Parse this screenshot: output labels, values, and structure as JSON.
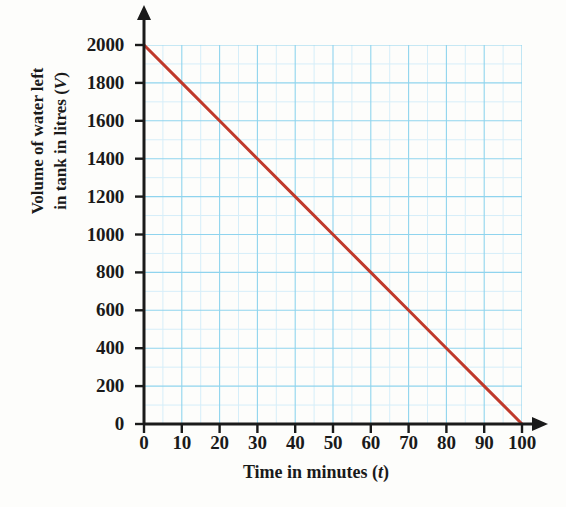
{
  "chart_data": {
    "type": "line",
    "title": "",
    "xlabel": "Time in minutes (t)",
    "xlabel_text": "Time in minutes",
    "xlabel_var": "t",
    "ylabel": "Volume of water left in tank in litres (V)",
    "ylabel_line1": "Volume of water left",
    "ylabel_line2_text": "in tank in litres",
    "ylabel_var": "V",
    "xlim": [
      0,
      100
    ],
    "ylim": [
      0,
      2000
    ],
    "xticks": [
      0,
      10,
      20,
      30,
      40,
      50,
      60,
      70,
      80,
      90,
      100
    ],
    "yticks": [
      0,
      200,
      400,
      600,
      800,
      1000,
      1200,
      1400,
      1600,
      1800,
      2000
    ],
    "xtick_labels": [
      "0",
      "10",
      "20",
      "30",
      "40",
      "50",
      "60",
      "70",
      "80",
      "90",
      "100"
    ],
    "ytick_labels": [
      "0",
      "200",
      "400",
      "600",
      "800",
      "1000",
      "1200",
      "1400",
      "1600",
      "1800",
      "2000"
    ],
    "x_minor_step": 5,
    "y_minor_step": 100,
    "grid": true,
    "grid_color": "#8fd4ee",
    "grid_minor_color": "#d6eef9",
    "legend": null,
    "series": [
      {
        "name": "Volume of water left in tank",
        "color": "#c0392b",
        "line_width": 3,
        "x": [
          0,
          10,
          20,
          30,
          40,
          50,
          60,
          70,
          80,
          90,
          100
        ],
        "values": [
          2000,
          1800,
          1600,
          1400,
          1200,
          1000,
          800,
          600,
          400,
          200,
          0
        ]
      }
    ],
    "slope_per_minute": -20,
    "intercept": 2000,
    "axis_color": "#1a1a1a",
    "background": "#fdfdfb"
  }
}
